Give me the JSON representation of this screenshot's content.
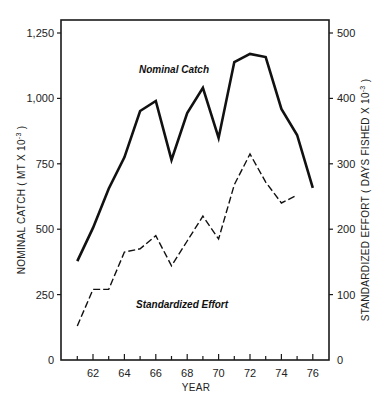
{
  "chart_data": {
    "type": "line",
    "title": "",
    "xlabel": "YEAR",
    "ylabel": "NOMINAL CATCH (MT X 10^-3)",
    "y2label": "STANDARDIZED EFFORT (DAYS FISHED X 10^-3)",
    "x": [
      61,
      62,
      63,
      64,
      65,
      66,
      67,
      68,
      69,
      70,
      71,
      72,
      73,
      74,
      75,
      76
    ],
    "x_tick_labels": [
      "62",
      "64",
      "66",
      "68",
      "70",
      "72",
      "74",
      "76"
    ],
    "y_tick_labels": [
      "0",
      "250",
      "500",
      "750",
      "1,000",
      "1,250"
    ],
    "y2_tick_labels": [
      "0",
      "100",
      "200",
      "300",
      "400",
      "500"
    ],
    "ylim": [
      0,
      1300
    ],
    "y2lim": [
      0,
      520
    ],
    "xlim": [
      60.3,
      77
    ],
    "grid": false,
    "legend": "inline labels",
    "series": [
      {
        "name": "Nominal Catch",
        "axis": "left",
        "style": "solid",
        "x": [
          61,
          62,
          63,
          64,
          65,
          66,
          67,
          68,
          69,
          70,
          71,
          72,
          73,
          74,
          75,
          76
        ],
        "values": [
          378,
          505,
          655,
          775,
          952,
          990,
          765,
          944,
          1040,
          849,
          1139,
          1170,
          1158,
          960,
          860,
          658
        ]
      },
      {
        "name": "Standardized Effort",
        "axis": "right",
        "style": "dashed",
        "x": [
          61,
          62,
          63,
          64,
          65,
          66,
          67,
          68,
          69,
          70,
          71,
          72,
          73,
          74,
          75
        ],
        "values": [
          52,
          108,
          108,
          165,
          170,
          190,
          144,
          182,
          220,
          185,
          268,
          315,
          272,
          240,
          252
        ]
      }
    ]
  },
  "labels": {
    "xlabel": "YEAR",
    "ylabel": "NOMINAL CATCH  ( MT X 10",
    "y2label": "STANDARDIZED EFFORT  ( DAYS FISHED X 10",
    "exp": "-3",
    "close": " )",
    "catch_series": "Nominal Catch",
    "effort_series": "Standardized Effort"
  }
}
